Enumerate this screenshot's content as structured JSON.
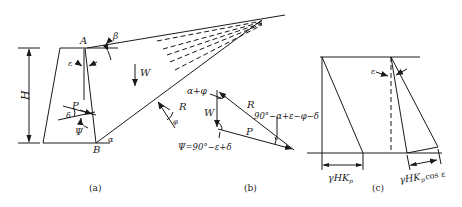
{
  "figure": {
    "panels": [
      {
        "id": "a",
        "caption": "(a)"
      },
      {
        "id": "b",
        "caption": "(b)"
      },
      {
        "id": "c",
        "caption": "(c)"
      }
    ]
  },
  "panel_a": {
    "point_A": "A",
    "point_B": "B",
    "height_label": "H",
    "angle_beta": "β",
    "angle_epsilon": "ε",
    "angle_delta": "δ",
    "angle_psi": "Ψ",
    "angle_alpha": "α",
    "angle_phi": "φ",
    "force_P": "P",
    "force_W": "W",
    "force_R": "R"
  },
  "panel_b": {
    "force_W": "W",
    "force_R": "R",
    "force_P": "P",
    "angle_top": "α+φ",
    "angle_right": "90°−α+ε−φ−δ",
    "angle_psi_eq": "Ψ=90°−ε+δ"
  },
  "panel_c": {
    "angle_epsilon": "ε",
    "dim_left": "γHK",
    "dim_left_sub": "p",
    "dim_right": "γHK",
    "dim_right_sub": "p",
    "dim_right_suffix": "cos ε"
  },
  "colors": {
    "line": "#1a1a1a",
    "background": "#ffffff"
  }
}
